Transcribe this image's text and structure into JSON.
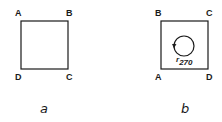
{
  "figure_a": {
    "caption": "a",
    "corners": {
      "top_left": "A",
      "top_right": "B",
      "bottom_left": "D",
      "bottom_right": "C"
    }
  },
  "figure_b": {
    "caption": "b",
    "corners": {
      "top_left": "B",
      "top_right": "C",
      "bottom_left": "A",
      "bottom_right": "D"
    },
    "rotation_label": "r",
    "rotation_subscript": "270",
    "rotation_icon": "counterclockwise-circle-arrow"
  },
  "colors": {
    "stroke": "#1a1a1a",
    "background": "#ffffff"
  }
}
